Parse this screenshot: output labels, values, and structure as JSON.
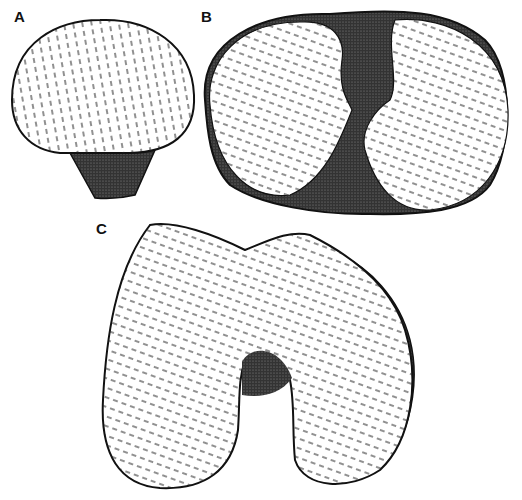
{
  "figure": {
    "panels": [
      {
        "id": "A",
        "label": "A",
        "description": "articular surface, rounded with dark shaded base"
      },
      {
        "id": "B",
        "label": "B",
        "description": "two oval condylar surfaces with dark central notch"
      },
      {
        "id": "C",
        "label": "C",
        "description": "bilobed condyles with central intercondylar notch"
      }
    ],
    "style": {
      "ink": "#1a1a1a",
      "paper": "#ffffff",
      "shade": "#2a2a2a"
    }
  }
}
